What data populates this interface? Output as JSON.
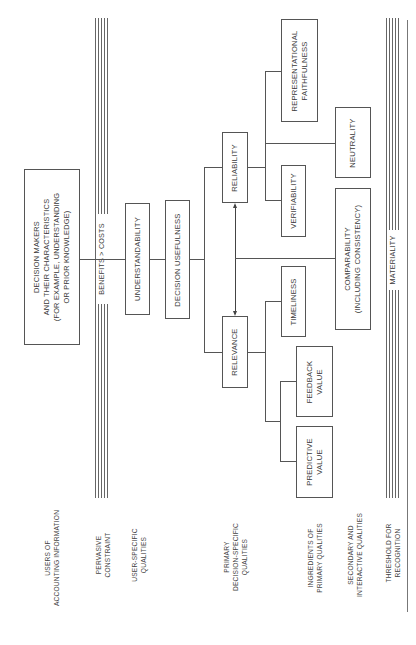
{
  "diagram": {
    "orientation": "rotated-90-ccw",
    "top_node": {
      "label_lines": [
        "DECISION MAKERS",
        "AND THEIR CHARACTERISTICS",
        "(FOR EXAMPLE, UNDERSTANDING",
        "OR PRIOR KNOWLEDGE)"
      ]
    },
    "constraint_band": {
      "label": "BENEFITS > COSTS"
    },
    "threshold_band": {
      "label": "MATERIALITY"
    },
    "nodes": {
      "understandability": "UNDERSTANDABILITY",
      "decision_usefulness": "DECISION USEFULNESS",
      "relevance": "RELEVANCE",
      "reliability": "RELIABILITY",
      "timeliness": "TIMELINESS",
      "feedback_value": [
        "FEEDBACK",
        "VALUE"
      ],
      "predictive_value": [
        "PREDICTIVE",
        "VALUE"
      ],
      "verifiability": "VERIFIABILITY",
      "representational_faithfulness": [
        "REPRESENTATIONAL",
        "FAITHFULNESS"
      ],
      "neutrality": "NEUTRALITY",
      "comparability": [
        "COMPARABILITY",
        "(INCLUDING CONSISTENCY)"
      ]
    },
    "row_labels": [
      [
        "USERS OF",
        "ACCOUNTING INFORMATION"
      ],
      [
        "PERVASIVE",
        "CONSTRAINT"
      ],
      [
        "USER-SPECIFIC",
        "QUALITIES"
      ],
      [
        "PRIMARY",
        "DECISION-SPECIFIC",
        "QUALITIES"
      ],
      [
        "INGREDIENTS OF",
        "PRIMARY QUALITIES"
      ],
      [
        "SECONDARY AND",
        "INTERACTIVE QUALITIES"
      ],
      [
        "THRESHOLD FOR",
        "RECOGNITION"
      ]
    ],
    "edges": [
      [
        "top_node",
        "understandability"
      ],
      [
        "understandability",
        "decision_usefulness"
      ],
      [
        "decision_usefulness",
        "relevance"
      ],
      [
        "decision_usefulness",
        "reliability"
      ],
      [
        "relevance",
        "reliability",
        "bidirectional"
      ],
      [
        "relevance",
        "timeliness"
      ],
      [
        "relevance",
        "feedback_value"
      ],
      [
        "relevance",
        "predictive_value"
      ],
      [
        "reliability",
        "verifiability"
      ],
      [
        "reliability",
        "neutrality"
      ],
      [
        "reliability",
        "representational_faithfulness"
      ],
      [
        "relevance-reliability-link",
        "comparability"
      ]
    ],
    "colors": {
      "line": "#555555",
      "text": "#3a3a3a",
      "background": "#ffffff"
    }
  }
}
